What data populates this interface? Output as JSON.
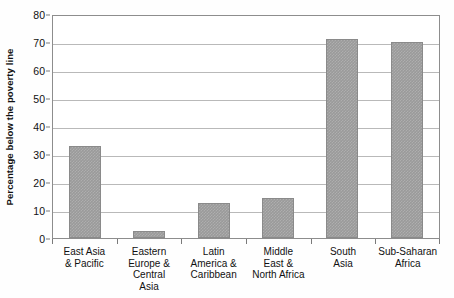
{
  "chart_data": {
    "type": "bar",
    "title": "",
    "xlabel": "",
    "ylabel": "Percentage below the poverty line",
    "categories": [
      "East Asia & Pacific",
      "Eastern Europe & Central Asia",
      "Latin America & Caribbean",
      "Middle East & North Africa",
      "South Asia",
      "Sub-Saharan Africa"
    ],
    "category_lines": [
      [
        "East Asia",
        "& Pacific"
      ],
      [
        "Eastern",
        "Europe &",
        "Central",
        "Asia"
      ],
      [
        "Latin",
        "America &",
        "Caribbean"
      ],
      [
        "Middle",
        "East &",
        "North Africa"
      ],
      [
        "South",
        "Asia"
      ],
      [
        "Sub-Saharan",
        "Africa"
      ]
    ],
    "values": [
      33,
      2.5,
      12.5,
      14.3,
      71,
      70
    ],
    "ylim": [
      0,
      80
    ],
    "ytick_values": [
      0,
      10,
      20,
      30,
      40,
      50,
      60,
      70,
      80
    ],
    "ytick_labels": [
      "0",
      "10",
      "20",
      "30",
      "40",
      "50",
      "60",
      "70",
      "80"
    ],
    "grid": true,
    "legend": "none",
    "bar_color": "#9a9a9a",
    "gridline_color": "#b9b9b9",
    "axis_color": "#8d8d8d",
    "background_color": "#ffffff"
  }
}
